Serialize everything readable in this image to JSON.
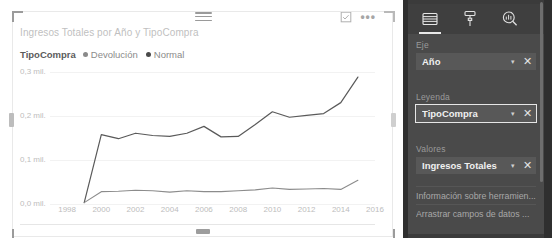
{
  "visual": {
    "title": "Ingresos Totales por Año y TipoCompra",
    "legend_title": "TipoCompra",
    "legend_items": [
      {
        "label": "Devolución",
        "color": "#8a8a8a"
      },
      {
        "label": "Normal",
        "color": "#4a4a4a"
      }
    ],
    "actions": {
      "focus_icon": "focus-mode-icon",
      "more_icon": "more-options-icon",
      "grip_icon": "drag-handle-icon"
    }
  },
  "chart_data": {
    "type": "line",
    "title": "Ingresos Totales por Año y TipoCompra",
    "xlabel": "",
    "ylabel": "",
    "xlim": [
      1997,
      2016
    ],
    "ylim": [
      0,
      0.3
    ],
    "grid": true,
    "legend_position": "top-left",
    "xticks": [
      "1998",
      "2000",
      "2002",
      "2004",
      "2006",
      "2008",
      "2010",
      "2012",
      "2014",
      "2016"
    ],
    "xtick_values": [
      1998,
      2000,
      2002,
      2004,
      2006,
      2008,
      2010,
      2012,
      2014,
      2016
    ],
    "yticks": [
      "0,0 mil.",
      "0,1 mil.",
      "0,2 mil.",
      "0,3 mil."
    ],
    "ytick_values": [
      0.0,
      0.1,
      0.2,
      0.3
    ],
    "x": [
      1999,
      2000,
      2001,
      2002,
      2003,
      2004,
      2005,
      2006,
      2007,
      2008,
      2009,
      2010,
      2011,
      2012,
      2013,
      2014,
      2015
    ],
    "series": [
      {
        "name": "Normal",
        "color": "#5a5a5a",
        "values": [
          0.003,
          0.152,
          0.143,
          0.155,
          0.15,
          0.148,
          0.155,
          0.17,
          0.147,
          0.148,
          0.174,
          0.202,
          0.19,
          0.194,
          0.198,
          0.222,
          0.278
        ]
      },
      {
        "name": "Devolución",
        "color": "#8c8c8c",
        "values": [
          0.003,
          0.027,
          0.028,
          0.03,
          0.029,
          0.026,
          0.029,
          0.027,
          0.027,
          0.029,
          0.031,
          0.035,
          0.032,
          0.033,
          0.034,
          0.032,
          0.052
        ]
      }
    ]
  },
  "pane": {
    "tabs": [
      {
        "name": "fields-tab",
        "icon": "fields-icon",
        "active": true
      },
      {
        "name": "format-tab",
        "icon": "paint-roller-icon",
        "active": false
      },
      {
        "name": "analytics-tab",
        "icon": "analytics-magnifier-icon",
        "active": false
      }
    ],
    "sections": [
      {
        "label": "Eje",
        "field": {
          "name": "Año",
          "selected": false,
          "caret": "▾",
          "remove": "✕"
        }
      },
      {
        "label": "Leyenda",
        "field": {
          "name": "TipoCompra",
          "selected": true,
          "caret": "▾",
          "remove": "✕"
        }
      },
      {
        "label": "Valores",
        "field": {
          "name": "Ingresos Totales",
          "selected": false,
          "caret": "▾",
          "remove": "✕"
        }
      }
    ],
    "dropzones": [
      {
        "label": "Información sobre herramien..."
      },
      {
        "label": "Arrastrar campos de datos ..."
      }
    ]
  }
}
